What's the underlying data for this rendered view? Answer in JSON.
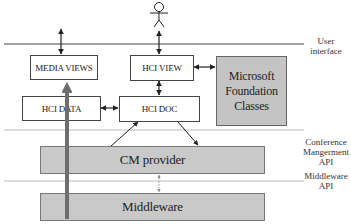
{
  "diagram": {
    "actor": {
      "label": "",
      "icon": "stick-figure-user"
    },
    "boxes": {
      "media_views": "MEDIA VIEWS",
      "hci_view": "HCI VIEW",
      "mfc": "Microsoft Foundation Classes",
      "hci_data": "HCI DATA",
      "hci_doc": "HCI DOC",
      "cm_provider": "CM provider",
      "middleware": "Middleware"
    },
    "layer_labels": {
      "user_interface": "User interface",
      "conference_mgmt_api": "Conference Mangerment API",
      "middleware_api": "Middleware API"
    },
    "connections": [
      {
        "from": "user_interface_line",
        "to": "media_views",
        "type": "bidirectional"
      },
      {
        "from": "actor",
        "to": "hci_view",
        "type": "bidirectional"
      },
      {
        "from": "hci_view",
        "to": "mfc",
        "type": "bidirectional"
      },
      {
        "from": "hci_view",
        "to": "hci_doc",
        "type": "bidirectional"
      },
      {
        "from": "hci_data",
        "to": "hci_doc",
        "type": "bidirectional"
      },
      {
        "from": "cm_provider",
        "to": "hci_doc",
        "type": "directed"
      },
      {
        "from": "hci_doc",
        "to": "cm_provider",
        "type": "directed"
      },
      {
        "from": "cm_provider",
        "to": "middleware",
        "type": "bidirectional-dashed"
      },
      {
        "from": "middleware",
        "to": "media_views",
        "type": "thick-data-flow"
      }
    ],
    "colors": {
      "gray_box": "#c4c4c4",
      "layer_box": "#c9c9c9",
      "thick_arrow": "#6e6e6e",
      "line": "#333333"
    }
  }
}
